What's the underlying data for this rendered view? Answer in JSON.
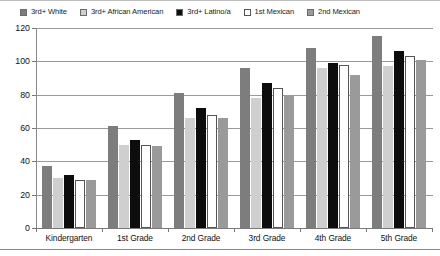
{
  "chart_data": {
    "type": "bar",
    "title": "",
    "xlabel": "",
    "ylabel": "",
    "ylim": [
      0,
      120
    ],
    "ytick_step": 20,
    "yticks": [
      "0",
      "20",
      "40",
      "60",
      "80",
      "100",
      "120"
    ],
    "grid": true,
    "legend_position": "top",
    "categories": [
      "Kindergarten",
      "1st Grade",
      "2nd Grade",
      "3rd Grade",
      "4th Grade",
      "5th Grade"
    ],
    "series": [
      {
        "name": "3rd+ White",
        "color": "#7d7d7d",
        "values": [
          37,
          61,
          81,
          96,
          108,
          115
        ]
      },
      {
        "name": "3rd+ African American",
        "color": "#cfcfcf",
        "values": [
          30,
          50,
          66,
          78,
          96,
          97
        ]
      },
      {
        "name": "3rd+ Latino/a",
        "color": "#0d0d0d",
        "values": [
          32,
          53,
          72,
          87,
          99,
          106
        ]
      },
      {
        "name": "1st Mexican",
        "color": "#ffffff",
        "values": [
          29,
          50,
          68,
          84,
          98,
          103
        ]
      },
      {
        "name": "2nd Mexican",
        "color": "#9a9a9a",
        "values": [
          29,
          49,
          66,
          80,
          92,
          101
        ]
      }
    ]
  },
  "legend": {
    "items": [
      {
        "label": "3rd+ White",
        "color": "#7d7d7d"
      },
      {
        "label": "3rd+ African American",
        "color": "#cfcfcf"
      },
      {
        "label": "3rd+ Latino/a",
        "color": "#0d0d0d"
      },
      {
        "label": "1st Mexican",
        "color": "#ffffff"
      },
      {
        "label": "2nd Mexican",
        "color": "#9a9a9a"
      }
    ]
  },
  "axes": {
    "y": {
      "labels": [
        "120",
        "100",
        "80",
        "60",
        "40",
        "20",
        "0"
      ]
    },
    "x": {
      "labels": [
        "Kindergarten",
        "1st Grade",
        "2nd Grade",
        "3rd Grade",
        "4th Grade",
        "5th Grade"
      ]
    }
  }
}
